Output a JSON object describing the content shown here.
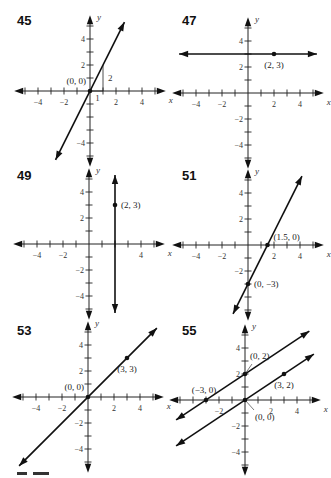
{
  "chart_data": [
    {
      "type": "line",
      "problem": "45",
      "xlabel": "x",
      "ylabel": "y",
      "xlim": [
        -5,
        5
      ],
      "ylim": [
        -5,
        5
      ],
      "xticks": [
        -4,
        -2,
        2,
        4
      ],
      "yticks": [
        -4,
        2,
        4
      ],
      "lines": [
        {
          "slope": 2,
          "intercept": 0
        }
      ],
      "points": [
        {
          "x": 0,
          "y": 0,
          "label": "(0, 0)",
          "labelPos": "left-above"
        }
      ],
      "slope_triangle": {
        "run": 1,
        "rise": 2,
        "run_label": "1",
        "rise_label": "2"
      }
    },
    {
      "type": "line",
      "problem": "47",
      "xlabel": "x",
      "ylabel": "y",
      "xlim": [
        -5,
        5
      ],
      "ylim": [
        -5,
        5
      ],
      "xticks": [
        -4,
        -2,
        2,
        4
      ],
      "yticks": [
        -4,
        -2,
        2,
        4
      ],
      "lines": [
        {
          "slope": 0,
          "intercept": 3
        }
      ],
      "points": [
        {
          "x": 2,
          "y": 3,
          "label": "(2, 3)",
          "labelPos": "below"
        }
      ]
    },
    {
      "type": "line",
      "problem": "49",
      "xlabel": "x",
      "ylabel": "y",
      "xlim": [
        -5,
        5
      ],
      "ylim": [
        -5,
        5
      ],
      "xticks": [
        -4,
        -2,
        4
      ],
      "yticks": [
        -4,
        -2,
        2,
        4
      ],
      "lines": [
        {
          "vertical": 2
        }
      ],
      "points": [
        {
          "x": 2,
          "y": 3,
          "label": "(2, 3)",
          "labelPos": "right"
        }
      ]
    },
    {
      "type": "line",
      "problem": "51",
      "xlabel": "x",
      "ylabel": "y",
      "xlim": [
        -5,
        5
      ],
      "ylim": [
        -5,
        5
      ],
      "xticks": [
        -4,
        -2,
        2,
        4
      ],
      "yticks": [
        -2,
        2,
        4
      ],
      "lines": [
        {
          "slope": 2,
          "intercept": -3
        }
      ],
      "points": [
        {
          "x": 1.5,
          "y": 0,
          "label": "(1.5, 0)",
          "labelPos": "right-above"
        },
        {
          "x": 0,
          "y": -3,
          "label": "(0, −3)",
          "labelPos": "right"
        }
      ]
    },
    {
      "type": "line",
      "problem": "53",
      "xlabel": "x",
      "ylabel": "y",
      "xlim": [
        -5,
        5
      ],
      "ylim": [
        -5,
        5
      ],
      "xticks": [
        -4,
        -2,
        2,
        4
      ],
      "yticks": [
        -4,
        -2,
        2,
        4
      ],
      "lines": [
        {
          "slope": 1,
          "intercept": 0
        }
      ],
      "points": [
        {
          "x": 0,
          "y": 0,
          "label": "(0, 0)",
          "labelPos": "left-above"
        },
        {
          "x": 3,
          "y": 3,
          "label": "(3, 3)",
          "labelPos": "below"
        }
      ]
    },
    {
      "type": "line",
      "problem": "55",
      "xlabel": "x",
      "ylabel": "y",
      "xlim": [
        -5,
        5
      ],
      "ylim": [
        -5,
        5
      ],
      "xticks": [
        -2,
        2,
        4
      ],
      "yticks": [
        -4,
        -2,
        2,
        4
      ],
      "lines": [
        {
          "slope": 0.6667,
          "intercept": 2
        },
        {
          "slope": 0.6667,
          "intercept": 0
        }
      ],
      "points": [
        {
          "x": 0,
          "y": 2,
          "label": "(0, 2)",
          "labelPos": "leader-up-right"
        },
        {
          "x": -3,
          "y": 0,
          "label": "(−3, 0)",
          "labelPos": "above"
        },
        {
          "x": 3,
          "y": 2,
          "label": "(3, 2)",
          "labelPos": "below"
        },
        {
          "x": 0,
          "y": 0,
          "label": "(0, 0)",
          "labelPos": "leader-down-right"
        }
      ]
    }
  ]
}
